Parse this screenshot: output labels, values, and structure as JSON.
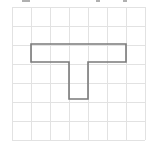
{
  "figure": {
    "grid": {
      "columns": 7,
      "rows": 7,
      "origin_x": 12,
      "origin_y": 7,
      "cell_size": 19,
      "line_color": "#e2e2e2"
    },
    "shape": {
      "name": "T-shape",
      "stroke_color": "#7a7a7a",
      "cells": [
        [
          1,
          2
        ],
        [
          2,
          2
        ],
        [
          3,
          2
        ],
        [
          4,
          2
        ],
        [
          5,
          2
        ],
        [
          3,
          3
        ],
        [
          3,
          4
        ]
      ],
      "outline_points": "31,44 126,44 126,62 88,62 88,99 69,99 69,62 31,62"
    },
    "header_fragments": {
      "note": "Partially cropped text at top edge (not legible)"
    }
  }
}
